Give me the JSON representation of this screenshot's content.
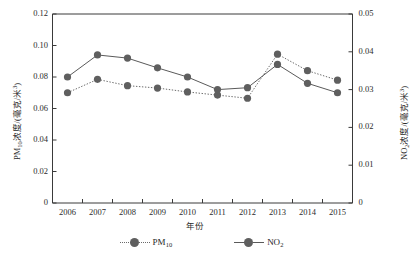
{
  "chart_data": {
    "type": "line",
    "title": "",
    "xlabel": "年份",
    "ylabel": "PM10浓度/(毫克/米3)",
    "y2label": "NO2浓度/(毫克/米3)",
    "grid": false,
    "legend_position": "bottom",
    "categories": [
      "2006",
      "2007",
      "2008",
      "2009",
      "2010",
      "2011",
      "2012",
      "2013",
      "2014",
      "2015"
    ],
    "x": [
      2006,
      2007,
      2008,
      2009,
      2010,
      2011,
      2012,
      2013,
      2014,
      2015
    ],
    "ylim": [
      0,
      0.12
    ],
    "yticks": [
      "0",
      "0.02",
      "0.04",
      "0.06",
      "0.08",
      "0.10",
      "0.12"
    ],
    "ytick_values": [
      0,
      0.02,
      0.04,
      0.06,
      0.08,
      0.1,
      0.12
    ],
    "y2lim": [
      0,
      0.05
    ],
    "y2ticks": [
      "0",
      "0.01",
      "0.02",
      "0.03",
      "0.04",
      "0.05"
    ],
    "y2tick_values": [
      0,
      0.01,
      0.02,
      0.03,
      0.04,
      0.05
    ],
    "xticks": [
      "2006",
      "2007",
      "2008",
      "2009",
      "2010",
      "2011",
      "2012",
      "2013",
      "2014",
      "2015"
    ],
    "series": [
      {
        "name": "PM10",
        "axis": "left",
        "line_style": "dotted",
        "color": "#5f5f5f",
        "values": [
          0.07,
          0.0785,
          0.0745,
          0.073,
          0.0705,
          0.0685,
          0.0665,
          0.0945,
          0.084,
          0.078
        ]
      },
      {
        "name": "NO2",
        "axis": "right",
        "line_style": "solid",
        "color": "#5f5f5f",
        "values": [
          0.0333,
          0.0392,
          0.0383,
          0.0358,
          0.0333,
          0.03,
          0.0305,
          0.0367,
          0.0317,
          0.0292
        ],
        "values_on_left_scale": [
          0.08,
          0.094,
          0.092,
          0.0858,
          0.08,
          0.072,
          0.0732,
          0.088,
          0.076,
          0.07
        ]
      }
    ],
    "legend": [
      {
        "label": "PM10",
        "style": "dotted"
      },
      {
        "label": "NO2",
        "style": "solid"
      }
    ]
  },
  "axes": {
    "left_title_main": "PM",
    "left_title_sub": "10",
    "left_title_rest": "浓度/(毫克/米",
    "left_title_sup": "3",
    "left_title_tail": ")",
    "right_title_main": "NO",
    "right_title_sub": "2",
    "right_title_rest": "浓度/(毫克/米",
    "right_title_sup": "3",
    "right_title_tail": ")",
    "x_title": "年份"
  },
  "legend_labels": {
    "pm10_main": "PM",
    "pm10_sub": "10",
    "no2_main": "NO",
    "no2_sub": "2"
  },
  "colors": {
    "marker": "#5f5f5f",
    "solid_line": "#5a5a5a",
    "dotted_line": "#6b6b6b",
    "axis": "#3a3a3a",
    "text": "#1f1f1f",
    "background": "#ffffff"
  }
}
